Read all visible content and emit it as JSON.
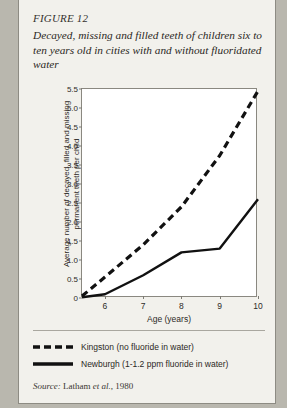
{
  "figure": {
    "number": "FIGURE 12",
    "title": "Decayed, missing and filled teeth of children six to ten years old in cities with and without fluoridated water",
    "source_label": "Source:",
    "source_author": "Latham",
    "source_italic": "et al.",
    "source_year": ", 1980"
  },
  "legend": {
    "items": [
      {
        "name": "kingston",
        "label": "Kingston (no fluoride in water)",
        "style": "dashed",
        "color": "#111111"
      },
      {
        "name": "newburgh",
        "label": "Newburgh (1-1.2 ppm fluoride in water)",
        "style": "solid",
        "color": "#111111"
      }
    ]
  },
  "chart_data": {
    "type": "line",
    "title": "Decayed, missing and filled teeth of children six to ten years old in cities with and without fluoridated water",
    "xlabel": "Age (years)",
    "ylabel": "Average number of decayed, filled and missing permanent teeth per child",
    "xlim": [
      5.4,
      10.0
    ],
    "ylim": [
      0,
      5.5
    ],
    "xticks": [
      6,
      7,
      8,
      9,
      10
    ],
    "yticks": [
      "0",
      "0.5",
      "1.0",
      "1.5",
      "2.0",
      "2.5",
      "3.0",
      "3.5",
      "4.0",
      "4.5",
      "5.0",
      "5.5"
    ],
    "ytick_values": [
      0,
      0.5,
      1.0,
      1.5,
      2.0,
      2.5,
      3.0,
      3.5,
      4.0,
      4.5,
      5.0,
      5.5
    ],
    "grid": false,
    "legend_position": "below-plot",
    "x": [
      5.4,
      6,
      7,
      8,
      9,
      10
    ],
    "series": [
      {
        "name": "Kingston (no fluoride in water)",
        "style": "dashed",
        "values": [
          0.05,
          0.55,
          1.4,
          2.4,
          3.75,
          5.45
        ]
      },
      {
        "name": "Newburgh (1-1.2 ppm fluoride in water)",
        "style": "solid",
        "values": [
          0.02,
          0.1,
          0.6,
          1.2,
          1.3,
          2.6
        ]
      }
    ]
  }
}
